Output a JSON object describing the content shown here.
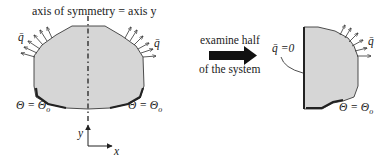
{
  "figure": {
    "title": "axis of symmetry = axis y",
    "colors": {
      "fill": "#d6d6d6",
      "stroke": "#2a2a2a",
      "arrow": "#1a1a1a"
    }
  },
  "left_system": {
    "flux_label_left": "q̄",
    "flux_label_right": "q̄",
    "bc_label_left": "Θ = Θ",
    "bc_label_left_sub": "o",
    "bc_label_right": "Θ = Θ",
    "bc_label_right_sub": "o",
    "axes": {
      "y_label": "y",
      "x_label": "x"
    }
  },
  "transition": {
    "label_top": "examine half",
    "label_bottom": "of the system"
  },
  "right_system": {
    "symmetry_bc_label": "q̄ =0",
    "flux_label": "q̄",
    "bc_label": "Θ = Θ",
    "bc_label_sub": "o"
  }
}
